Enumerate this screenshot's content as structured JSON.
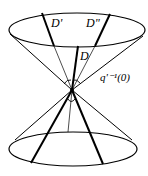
{
  "figure": {
    "type": "double-cone-diagram",
    "labels": {
      "d_prime": "D'",
      "d_double_prime": "D\"",
      "d": "D",
      "fiber": "q'⁻¹(0)"
    },
    "colors": {
      "stroke": "#000000",
      "background": "#ffffff"
    }
  }
}
